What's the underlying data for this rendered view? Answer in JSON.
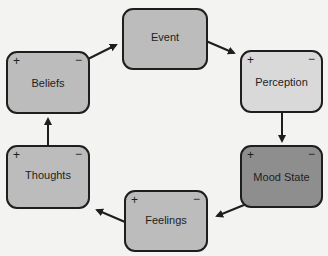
{
  "diagram": {
    "type": "cycle",
    "nodes": [
      {
        "id": "event",
        "label": "Event",
        "plus": "",
        "minus": "",
        "fill": "#bcbcbc"
      },
      {
        "id": "perception",
        "label": "Perception",
        "plus": "+",
        "minus": "−",
        "fill": "#d9d9d9"
      },
      {
        "id": "mood-state",
        "label": "Mood State",
        "plus": "+",
        "minus": "−",
        "fill": "#8e8e8e"
      },
      {
        "id": "feelings",
        "label": "Feelings",
        "plus": "+",
        "minus": "−",
        "fill": "#bcbcbc"
      },
      {
        "id": "thoughts",
        "label": "Thoughts",
        "plus": "+",
        "minus": "−",
        "fill": "#bcbcbc"
      },
      {
        "id": "beliefs",
        "label": "Beliefs",
        "plus": "+",
        "minus": "−",
        "fill": "#bcbcbc"
      }
    ],
    "edges": [
      {
        "from": "event",
        "to": "perception"
      },
      {
        "from": "perception",
        "to": "mood-state"
      },
      {
        "from": "mood-state",
        "to": "feelings"
      },
      {
        "from": "feelings",
        "to": "thoughts"
      },
      {
        "from": "thoughts",
        "to": "beliefs"
      },
      {
        "from": "beliefs",
        "to": "event"
      }
    ]
  }
}
